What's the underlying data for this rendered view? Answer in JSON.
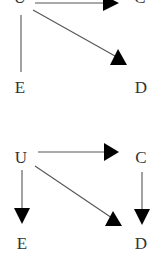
{
  "diagrams": [
    {
      "name": "top-dag",
      "nodes": {
        "U": {
          "label": "U",
          "x": 20,
          "y": 3
        },
        "C": {
          "label": "C",
          "x": 140,
          "y": 3
        },
        "E": {
          "label": "E",
          "x": 20,
          "y": 93
        },
        "D": {
          "label": "D",
          "x": 140,
          "y": 93
        }
      },
      "edges": [
        {
          "from": "U",
          "to": "C",
          "directed": true
        },
        {
          "from": "U",
          "to": "D",
          "directed": true
        },
        {
          "from": "U",
          "to": "E",
          "directed": false
        }
      ]
    },
    {
      "name": "bottom-dag",
      "nodes": {
        "U": {
          "label": "U",
          "x": 21,
          "y": 163
        },
        "C": {
          "label": "C",
          "x": 141,
          "y": 163
        },
        "E": {
          "label": "E",
          "x": 22,
          "y": 249
        },
        "D": {
          "label": "D",
          "x": 141,
          "y": 249
        }
      },
      "edges": [
        {
          "from": "U",
          "to": "C",
          "directed": true
        },
        {
          "from": "U",
          "to": "D",
          "directed": true
        },
        {
          "from": "U",
          "to": "E",
          "directed": true
        },
        {
          "from": "C",
          "to": "D",
          "directed": true
        }
      ]
    }
  ],
  "colors": {
    "edge": "#555555",
    "arrowhead": "#000000",
    "label": "#333333",
    "background": "#ffffff"
  }
}
